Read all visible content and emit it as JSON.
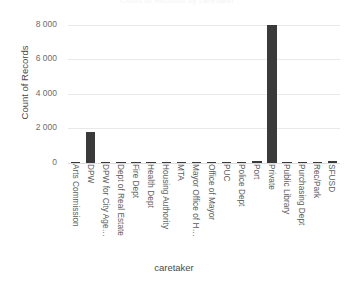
{
  "figure": {
    "title_fragment": "Count of Records by caretaker",
    "background_color": "#ffffff",
    "bar_color": "#3a3a3a",
    "gridline_color": "#e9e9e9"
  },
  "axes": {
    "y_title": "Count of Records",
    "x_title": "caretaker",
    "y_ticks": [
      "8 000",
      "6 000",
      "4 000",
      "2 000",
      "0"
    ]
  },
  "chart_data": {
    "type": "bar",
    "title": "Count of Records by caretaker",
    "xlabel": "caretaker",
    "ylabel": "Count of Records",
    "ylim": [
      0,
      8400
    ],
    "ytick_values": [
      0,
      2000,
      4000,
      6000,
      8000
    ],
    "ytick_labels": [
      "0",
      "2 000",
      "4 000",
      "6 000",
      "8 000"
    ],
    "grid": true,
    "legend": false,
    "orientation": "vertical",
    "categories": [
      "Arts Commission",
      "DPW",
      "DPW for City Age…",
      "Dept of Real Estate",
      "Fire Dept",
      "Health Dept",
      "Housing Authority",
      "MTA",
      "Mayor Office of H…",
      "Office of Mayor",
      "PUC",
      "Police Dept",
      "Port",
      "Private",
      "Public Library",
      "Purchasing Dept",
      "Rec/Park",
      "SFUSD"
    ],
    "values": [
      10,
      1800,
      25,
      15,
      20,
      10,
      10,
      5,
      5,
      5,
      45,
      15,
      110,
      8000,
      10,
      5,
      60,
      95
    ]
  }
}
